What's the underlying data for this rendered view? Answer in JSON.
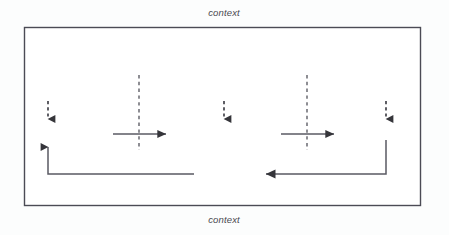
{
  "diagram": {
    "title_top": "context",
    "title_bottom": "context",
    "frame": {
      "stroke": "#4b4b55",
      "fill": "#ffffff"
    },
    "ink": "#3a3a3e",
    "nodes": [
      {
        "id": "transmitter",
        "label": "transmitter"
      },
      {
        "id": "message",
        "label": "message"
      },
      {
        "id": "receiver",
        "label": "receiver"
      }
    ],
    "annotations": [
      {
        "id": "coding",
        "label": "coding"
      },
      {
        "id": "channel",
        "label": "channel"
      },
      {
        "id": "decoding",
        "label": "decoding"
      },
      {
        "id": "perceptual-filters-left",
        "label": "perceptual filters"
      },
      {
        "id": "perceptual-filters-right",
        "label": "perceptual filters"
      },
      {
        "id": "noise-left",
        "label": "noise"
      },
      {
        "id": "noise-right",
        "label": "noise"
      },
      {
        "id": "feedback",
        "label": "feedback"
      }
    ]
  }
}
